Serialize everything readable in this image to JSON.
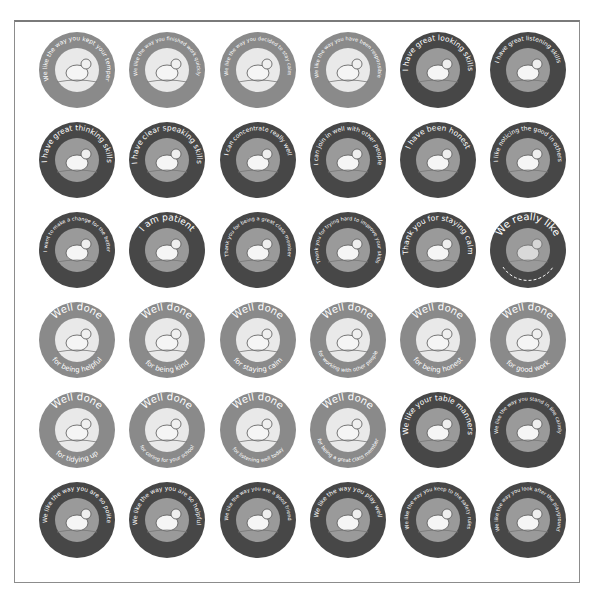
{
  "sheet": {
    "colors": {
      "light": "#8a8a8a",
      "dark": "#474747",
      "frame": "#8c8c8c",
      "text": "#ffffff"
    },
    "stickers": [
      {
        "row": 1,
        "col": 1,
        "style": "light",
        "top": "",
        "bottom": "We like the way you kept your temper",
        "scene": "rhino",
        "icon": "rhino-icon"
      },
      {
        "row": 1,
        "col": 2,
        "style": "light",
        "top": "",
        "bottom": "We like the way you finished work quickly",
        "scene": "insect",
        "icon": "insect-icon"
      },
      {
        "row": 1,
        "col": 3,
        "style": "light",
        "top": "",
        "bottom": "We like the way you decided to stay calm",
        "scene": "fish",
        "icon": "fish-icon"
      },
      {
        "row": 1,
        "col": 4,
        "style": "light",
        "top": "",
        "bottom": "We like the way you have been responsible",
        "scene": "squirrel",
        "icon": "squirrel-icon"
      },
      {
        "row": 1,
        "col": 5,
        "style": "dark",
        "top": "",
        "bottom": "I have great looking skills",
        "scene": "eagle",
        "icon": "eagle-icon"
      },
      {
        "row": 1,
        "col": 6,
        "style": "dark",
        "top": "",
        "bottom": "I have great listening skills",
        "scene": "bat",
        "icon": "bat-icon"
      },
      {
        "row": 2,
        "col": 1,
        "style": "dark",
        "top": "",
        "bottom": "I have great thinking skills",
        "scene": "owl",
        "icon": "owl-icon"
      },
      {
        "row": 2,
        "col": 2,
        "style": "dark",
        "top": "",
        "bottom": "I have clear speaking skills",
        "scene": "rooster",
        "icon": "rooster-icon"
      },
      {
        "row": 2,
        "col": 3,
        "style": "dark",
        "top": "",
        "bottom": "I can concentrate really well",
        "scene": "heron",
        "icon": "heron-icon"
      },
      {
        "row": 2,
        "col": 4,
        "style": "dark",
        "top": "",
        "bottom": "I can join in well with other people",
        "scene": "sheep",
        "icon": "sheep-icon"
      },
      {
        "row": 2,
        "col": 5,
        "style": "dark",
        "top": "",
        "bottom": "I have been honest",
        "scene": "kangaroo",
        "icon": "kangaroo-icon"
      },
      {
        "row": 2,
        "col": 6,
        "style": "dark",
        "top": "",
        "bottom": "I like noticing the good in others",
        "scene": "pigs",
        "icon": "pigs-icon"
      },
      {
        "row": 3,
        "col": 1,
        "style": "dark",
        "top": "",
        "bottom": "I want to make a change for the better",
        "scene": "dalmatian",
        "icon": "dalmatian-icon"
      },
      {
        "row": 3,
        "col": 2,
        "style": "dark",
        "top": "",
        "bottom": "I am patient",
        "scene": "dog",
        "icon": "dog-icon"
      },
      {
        "row": 3,
        "col": 3,
        "style": "dark",
        "top": "",
        "bottom": "Thank you for being a great class member",
        "scene": "animals",
        "icon": "animals-icon"
      },
      {
        "row": 3,
        "col": 4,
        "style": "dark",
        "top": "",
        "bottom": "Thank you for trying hard to improve your skills",
        "scene": "parachute",
        "icon": "parachute-icon"
      },
      {
        "row": 3,
        "col": 5,
        "style": "dark",
        "top": "",
        "bottom": "Thank you for staying calm",
        "scene": "dolphin",
        "icon": "dolphin-icon"
      },
      {
        "row": 3,
        "col": 6,
        "style": "dark",
        "top": "We really like",
        "bottom": "",
        "scene": "blank",
        "icon": "blank-line-icon"
      },
      {
        "row": 4,
        "col": 1,
        "style": "light",
        "top": "Well done",
        "bottom": "for being helpful",
        "scene": "camel",
        "icon": "camel-icon"
      },
      {
        "row": 4,
        "col": 2,
        "style": "light",
        "top": "Well done",
        "bottom": "for being kind",
        "scene": "lion",
        "icon": "lion-icon"
      },
      {
        "row": 4,
        "col": 3,
        "style": "light",
        "top": "Well done",
        "bottom": "for staying calm",
        "scene": "dolphins",
        "icon": "dolphins-icon"
      },
      {
        "row": 4,
        "col": 4,
        "style": "light",
        "top": "Well done",
        "bottom": "for working with other people",
        "scene": "mice",
        "icon": "mice-icon"
      },
      {
        "row": 4,
        "col": 5,
        "style": "light",
        "top": "Well done",
        "bottom": "for being honest",
        "scene": "kangaroos",
        "icon": "kangaroos-icon"
      },
      {
        "row": 4,
        "col": 6,
        "style": "light",
        "top": "Well done",
        "bottom": "for good work",
        "scene": "ant",
        "icon": "ant-icon"
      },
      {
        "row": 5,
        "col": 1,
        "style": "light",
        "top": "Well done",
        "bottom": "for tidying up",
        "scene": "hedgehog",
        "icon": "hedgehog-icon"
      },
      {
        "row": 5,
        "col": 2,
        "style": "light",
        "top": "Well done",
        "bottom": "for caring for your school",
        "scene": "elephant",
        "icon": "elephant-icon"
      },
      {
        "row": 5,
        "col": 3,
        "style": "light",
        "top": "Well done",
        "bottom": "for listening well today",
        "scene": "hare",
        "icon": "hare-icon"
      },
      {
        "row": 5,
        "col": 4,
        "style": "light",
        "top": "Well done",
        "bottom": "for being a great class member",
        "scene": "bus",
        "icon": "bus-icon"
      },
      {
        "row": 5,
        "col": 5,
        "style": "dark",
        "top": "",
        "bottom": "We like your table manners",
        "scene": "hamster",
        "icon": "hamster-icon"
      },
      {
        "row": 5,
        "col": 6,
        "style": "dark",
        "top": "",
        "bottom": "We like the way you stand in line calmly",
        "scene": "penguins",
        "icon": "penguins-icon"
      },
      {
        "row": 6,
        "col": 1,
        "style": "dark",
        "top": "",
        "bottom": "We like the way you are so polite",
        "scene": "cats",
        "icon": "cats-icon"
      },
      {
        "row": 6,
        "col": 2,
        "style": "dark",
        "top": "",
        "bottom": "We like the way you are so helpful",
        "scene": "camel",
        "icon": "camel-icon"
      },
      {
        "row": 6,
        "col": 3,
        "style": "dark",
        "top": "",
        "bottom": "We like the way you are a good friend",
        "scene": "elephants",
        "icon": "elephants-icon"
      },
      {
        "row": 6,
        "col": 4,
        "style": "dark",
        "top": "",
        "bottom": "We like the way you play well",
        "scene": "bears",
        "icon": "bears-icon"
      },
      {
        "row": 6,
        "col": 5,
        "style": "dark",
        "top": "",
        "bottom": "We like the way you keep to the safety rules",
        "scene": "monkey",
        "icon": "monkey-icon"
      },
      {
        "row": 6,
        "col": 6,
        "style": "dark",
        "top": "",
        "bottom": "We like the way you look after the playground",
        "scene": "giraffe",
        "icon": "giraffe-icon"
      }
    ]
  }
}
